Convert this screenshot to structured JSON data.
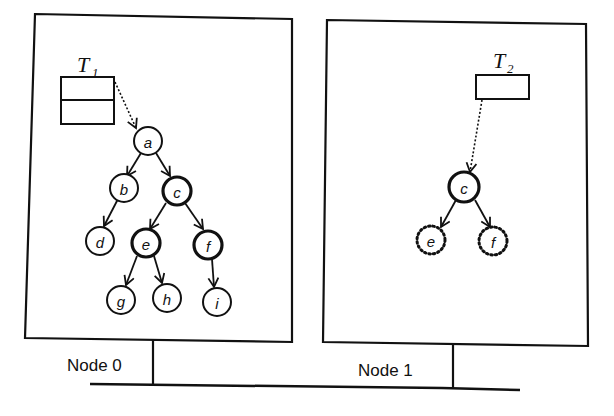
{
  "nodes_machines": [
    {
      "label": "Node 0"
    },
    {
      "label": "Node 1"
    }
  ],
  "tables": [
    {
      "name": "T",
      "sub": "1",
      "rows": 2
    },
    {
      "name": "T",
      "sub": "2",
      "rows": 1
    }
  ],
  "tree_node0": {
    "nodes": [
      {
        "id": "a",
        "label": "a",
        "style": "normal"
      },
      {
        "id": "b",
        "label": "b",
        "style": "normal"
      },
      {
        "id": "c",
        "label": "c",
        "style": "bold"
      },
      {
        "id": "d",
        "label": "d",
        "style": "normal"
      },
      {
        "id": "e",
        "label": "e",
        "style": "bold"
      },
      {
        "id": "f",
        "label": "f",
        "style": "bold"
      },
      {
        "id": "g",
        "label": "g",
        "style": "normal"
      },
      {
        "id": "h",
        "label": "h",
        "style": "normal"
      },
      {
        "id": "i",
        "label": "i",
        "style": "normal"
      }
    ],
    "edges": [
      [
        "a",
        "b"
      ],
      [
        "a",
        "c"
      ],
      [
        "b",
        "d"
      ],
      [
        "c",
        "e"
      ],
      [
        "c",
        "f"
      ],
      [
        "e",
        "g"
      ],
      [
        "e",
        "h"
      ],
      [
        "f",
        "i"
      ]
    ],
    "root_pointer": {
      "from": "T1",
      "to": "a"
    }
  },
  "tree_node1": {
    "nodes": [
      {
        "id": "c",
        "label": "c",
        "style": "bold"
      },
      {
        "id": "e",
        "label": "e",
        "style": "dotted"
      },
      {
        "id": "f",
        "label": "f",
        "style": "dotted"
      }
    ],
    "edges": [
      [
        "c",
        "e"
      ],
      [
        "c",
        "f"
      ]
    ],
    "root_pointer": {
      "from": "T2",
      "to": "c"
    }
  }
}
